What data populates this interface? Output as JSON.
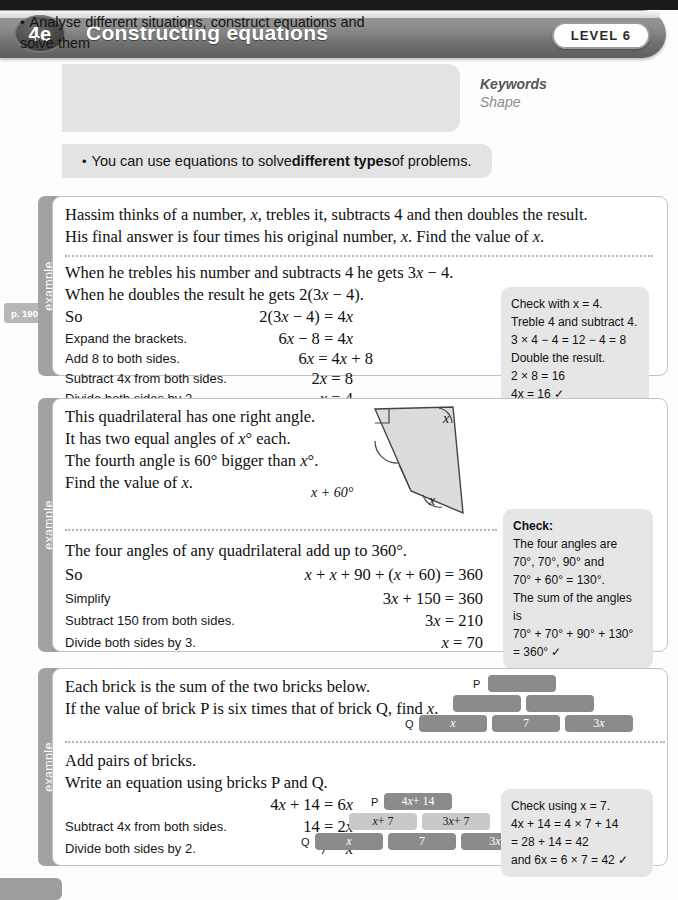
{
  "header": {
    "unit_code": "4e",
    "title": "Constructing equations",
    "level_badge": "LEVEL 6"
  },
  "objective": {
    "bullet": "•",
    "text": "Analyse different situations, construct equations and solve them",
    "keywords_title": "Keywords",
    "keywords_word": "Shape"
  },
  "statement": {
    "bullet": "•",
    "prefix": "You can use equations to solve ",
    "bold": "different types",
    "suffix": " of problems."
  },
  "page_ref": "p. 190",
  "example_tab_label": "example",
  "examples": [
    {
      "tab": "example",
      "problem_lines": [
        "Hassim thinks of a number, x, trebles it, subtracts 4 and then doubles the result.",
        "His final answer is four times his original number, x. Find the value of x."
      ],
      "solution_intro": [
        "When he trebles his number and subtracts 4 he gets 3x − 4.",
        "When he doubles the result he gets 2(3x − 4)."
      ],
      "steps": [
        {
          "label": "So",
          "label_serif": true,
          "equation": "2(3x − 4) = 4x"
        },
        {
          "label": "Expand the brackets.",
          "label_serif": false,
          "equation": "6x − 8 = 4x"
        },
        {
          "label": "Add 8 to both sides.",
          "label_serif": false,
          "equation": "6x = 4x + 8"
        },
        {
          "label": "Subtract 4x from both sides.",
          "label_serif": false,
          "equation": "2x = 8"
        },
        {
          "label": "Divide both sides by 2.",
          "label_serif": false,
          "equation": "x = 4"
        }
      ],
      "check": {
        "title": "",
        "lines": [
          "Check with x = 4.",
          "Treble 4 and subtract 4.",
          "3 × 4 − 4 = 12 − 4 = 8",
          "Double the result.",
          "2 × 8 = 16",
          "4x = 16 ✓"
        ]
      }
    },
    {
      "tab": "example",
      "problem_lines": [
        "This quadrilateral has one right angle.",
        "It has two equal angles of x° each.",
        "The fourth angle is 60° bigger than x°.",
        "Find the value of x."
      ],
      "diagram": {
        "type": "quadrilateral",
        "angle_labels": [
          {
            "name": "right-angle",
            "text": ""
          },
          {
            "name": "top-right-angle",
            "text": "x"
          },
          {
            "name": "bottom-right-angle",
            "text": "x"
          },
          {
            "name": "bottom-left-angle",
            "text": "x + 60°"
          }
        ]
      },
      "solution_intro": [
        "The four angles of any quadrilateral add up to 360°."
      ],
      "steps": [
        {
          "label": "So",
          "label_serif": true,
          "equation": "x + x + 90 + (x + 60) = 360"
        },
        {
          "label": "Simplify",
          "label_serif": false,
          "equation": "3x + 150 = 360"
        },
        {
          "label": "Subtract 150 from both sides.",
          "label_serif": false,
          "equation": "3x = 210"
        },
        {
          "label": "Divide both sides by 3.",
          "label_serif": false,
          "equation": "x = 70"
        }
      ],
      "check": {
        "title": "Check:",
        "lines": [
          "The four angles are",
          "70°, 70°, 90° and",
          "70° + 60° = 130°.",
          "The sum of the angles is",
          "70° + 70° + 90° + 130°",
          "= 360° ✓"
        ]
      }
    },
    {
      "tab": "example",
      "problem_lines": [
        "Each brick is the sum of the two bricks below.",
        "If the value of brick P is six times that of brick Q, find x."
      ],
      "solution_intro": [
        "Add pairs of bricks.",
        "Write an equation using bricks P and Q."
      ],
      "steps": [
        {
          "label": "",
          "label_serif": true,
          "equation": "4x + 14 = 6x"
        },
        {
          "label": "Subtract 4x from both sides.",
          "label_serif": false,
          "equation": "14 = 2x"
        },
        {
          "label": "Divide both sides by 2.",
          "label_serif": false,
          "equation": "7 = x"
        }
      ],
      "check": {
        "title": "",
        "lines": [
          "Check using x = 7.",
          "4x + 14 = 4 × 7 + 14",
          "= 28 + 14 = 42",
          "and 6x = 6 × 7 = 42 ✓"
        ]
      }
    }
  ],
  "brick_diagram_top": {
    "top_tag": "P",
    "bottom_tag": "Q",
    "rows": [
      {
        "cells": [
          ""
        ]
      },
      {
        "cells": [
          "",
          ""
        ]
      },
      {
        "cells": [
          "x",
          "7",
          "3x"
        ]
      }
    ]
  },
  "brick_diagram_bottom": {
    "top_tag": "P",
    "bottom_tag": "Q",
    "rows": [
      {
        "cells": [
          "4x + 14"
        ]
      },
      {
        "cells": [
          "x + 7",
          "3x + 7"
        ]
      },
      {
        "cells": [
          "x",
          "7",
          "3x"
        ]
      }
    ]
  },
  "colors": {
    "banner_dark": "#5e5e5e",
    "panel_gray": "#e3e3e3",
    "check_gray": "#e6e6e6",
    "brick_dark": "#8b8b8b",
    "brick_light": "#c9c9c9",
    "tab_gray": "#a2a2a2"
  }
}
